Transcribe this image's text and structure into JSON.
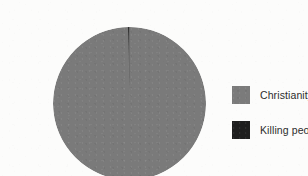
{
  "background_color": "#fcfcfb",
  "chart_data": {
    "type": "pie",
    "title": "",
    "subtitle": "",
    "xlabel": "",
    "ylabel": "",
    "grid": false,
    "legend_position": "right",
    "categories": [
      "Christianity",
      "Killing people"
    ],
    "values": [
      99.7,
      0.3
    ],
    "value_unit": "%",
    "colors": [
      "#7b7b7b",
      "#1e1e1e"
    ],
    "annotations": [],
    "slices": [
      {
        "label": "Christianity",
        "value": 99.7,
        "color": "#7b7b7b"
      },
      {
        "label": "Killing people",
        "value": 0.3,
        "color": "#1e1e1e"
      }
    ]
  },
  "legend": {
    "items": [
      {
        "label": "Christianity",
        "swatch_color": "#7b7b7b"
      },
      {
        "label": "Killing people",
        "swatch_color": "#1e1e1e"
      }
    ]
  },
  "pie": {
    "center_x": 76.5,
    "center_y": 76.5,
    "radius": 76.5
  }
}
